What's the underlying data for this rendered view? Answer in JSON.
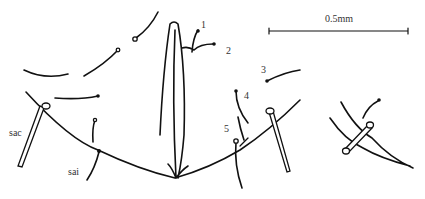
{
  "figure": {
    "scale_bar": {
      "label": "0.5mm"
    },
    "labels": {
      "seta_1": "1",
      "seta_2": "2",
      "seta_3": "3",
      "seta_4": "4",
      "seta_5": "5",
      "sac": "sac",
      "sai": "sai"
    }
  }
}
